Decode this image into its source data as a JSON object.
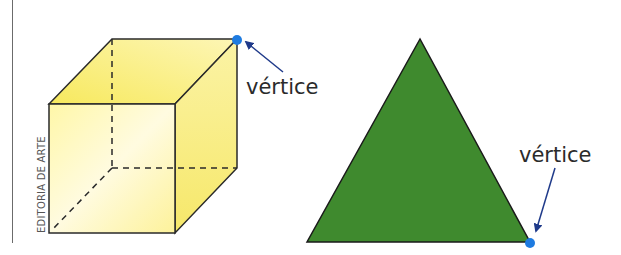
{
  "credit": "EDITORIA DE ARTE",
  "figures": [
    {
      "name": "cube",
      "fill_color": "#fbf49a",
      "edge_color": "#2a2a2a",
      "vertex_label": "vértice",
      "vertex_marker_color": "#1e7be0",
      "arrow_color": "#1f3a8a"
    },
    {
      "name": "triangle",
      "fill_color": "#3f8a2e",
      "edge_color": "#1a1a1a",
      "vertex_label": "vértice",
      "vertex_marker_color": "#1e7be0",
      "arrow_color": "#1f3a8a"
    }
  ]
}
